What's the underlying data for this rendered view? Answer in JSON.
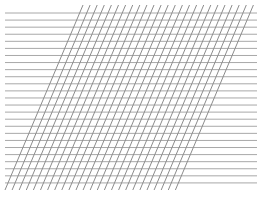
{
  "figure": {
    "colors": {
      "background": "#ffffff",
      "horizontal_lines": "#a8a8a8",
      "diagonal_lines": "#8c8c8c"
    },
    "horizontal": {
      "count": 25,
      "x_start": 5,
      "x_end": 257,
      "y_first": 13,
      "spacing": 7.08,
      "stroke_width": 1
    },
    "diagonal": {
      "count": 25,
      "top_y": 5,
      "bottom_y": 190,
      "top_x_first": 83,
      "bottom_x_first": 5,
      "spacing": 7.1,
      "stroke_width": 1
    }
  }
}
